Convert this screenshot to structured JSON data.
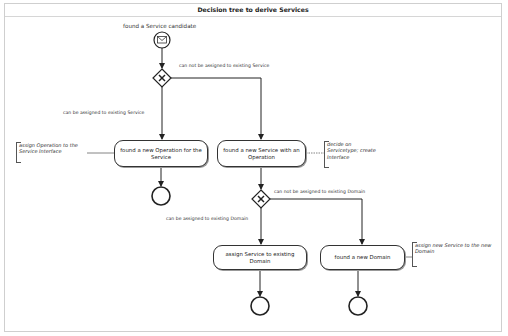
{
  "diagram": {
    "title": "Decision tree to derive Services",
    "start_event": {
      "label": "found a Service candidate",
      "icon": "envelope-icon"
    },
    "gateways": [
      {
        "id": "gw1",
        "type": "exclusive",
        "icon": "x-icon"
      },
      {
        "id": "gw2",
        "type": "exclusive",
        "icon": "x-icon"
      }
    ],
    "flow_labels": {
      "gw1_no": "can not be assigned to existing Service",
      "gw1_yes": "can be assigned to existing Service",
      "gw2_no": "can not be assigned to existing Domain",
      "gw2_yes": "can be assigned to existing Domain"
    },
    "tasks": [
      {
        "id": "t1",
        "label": "found a new Operation for the Service"
      },
      {
        "id": "t2",
        "label": "found a new Service with an Operation"
      },
      {
        "id": "t3",
        "label": "assign Service to existing Domain"
      },
      {
        "id": "t4",
        "label": "found a new Domain"
      }
    ],
    "annotations": [
      {
        "for": "t1",
        "lines": [
          "assign Operation to the",
          "Service Interface"
        ]
      },
      {
        "for": "t2",
        "lines": [
          "decide on",
          "Servicetype; create",
          "Interface"
        ]
      },
      {
        "for": "t4",
        "lines": [
          "assign new Service to the new",
          "Domain"
        ]
      }
    ],
    "end_events": 3
  }
}
